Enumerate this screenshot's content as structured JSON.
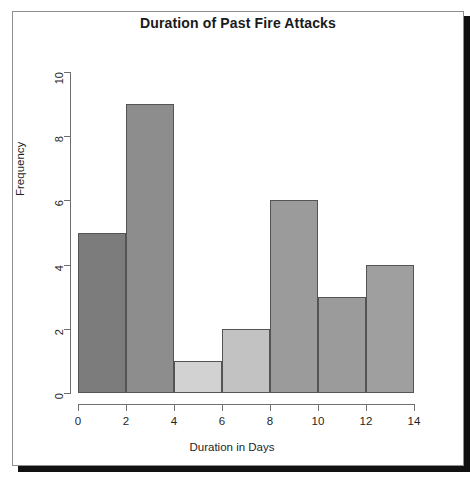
{
  "figure": {
    "background_color": "#ffffff",
    "frame_color": "#8e8e8e",
    "shadow_color": "#111111"
  },
  "chart_data": {
    "type": "bar",
    "subtype": "histogram",
    "title": "Duration of Past Fire Attacks",
    "xlabel": "Duration in Days",
    "ylabel": "Frequency",
    "xlim": [
      0,
      14
    ],
    "ylim": [
      0,
      10
    ],
    "bin_width": 2,
    "grid": false,
    "legend": null,
    "x_ticks": [
      0,
      2,
      4,
      6,
      8,
      10,
      12,
      14
    ],
    "x_tick_labels": [
      "0",
      "2",
      "4",
      "6",
      "8",
      "10",
      "12",
      "14"
    ],
    "y_ticks": [
      0,
      2,
      4,
      6,
      8,
      10
    ],
    "y_tick_labels": [
      "0",
      "2",
      "4",
      "6",
      "8",
      "10"
    ],
    "categories": [
      "0-2",
      "2-4",
      "4-6",
      "6-8",
      "8-10",
      "10-12",
      "12-14"
    ],
    "bin_edges": [
      0,
      2,
      4,
      6,
      8,
      10,
      12,
      14
    ],
    "values": [
      5,
      9,
      1,
      2,
      6,
      3,
      4
    ],
    "bar_colors": [
      "#7c7c7c",
      "#8d8d8d",
      "#d2d2d2",
      "#c2c2c2",
      "#9b9b9b",
      "#9b9b9b",
      "#9f9f9f"
    ],
    "bar_border_color": "#545454",
    "axis_color": "#6f6f6f",
    "text_color": "#1f1f1f",
    "bars": [
      {
        "label": "0-2",
        "start": 0,
        "end": 2,
        "value": 5,
        "color": "#7c7c7c"
      },
      {
        "label": "2-4",
        "start": 2,
        "end": 4,
        "value": 9,
        "color": "#8d8d8d"
      },
      {
        "label": "4-6",
        "start": 4,
        "end": 6,
        "value": 1,
        "color": "#d2d2d2"
      },
      {
        "label": "6-8",
        "start": 6,
        "end": 8,
        "value": 2,
        "color": "#c2c2c2"
      },
      {
        "label": "8-10",
        "start": 8,
        "end": 10,
        "value": 6,
        "color": "#9b9b9b"
      },
      {
        "label": "10-12",
        "start": 10,
        "end": 12,
        "value": 3,
        "color": "#9b9b9b"
      },
      {
        "label": "12-14",
        "start": 12,
        "end": 14,
        "value": 4,
        "color": "#9f9f9f"
      }
    ]
  }
}
